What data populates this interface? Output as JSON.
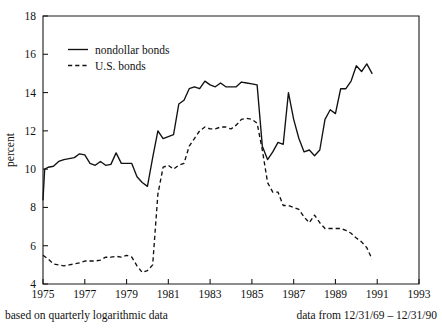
{
  "chart_data": {
    "type": "line",
    "title": "",
    "xlabel": "",
    "ylabel": "percent",
    "xlim": [
      1975,
      1993
    ],
    "ylim": [
      4,
      18
    ],
    "grid": false,
    "legend_position": "top-left-inside",
    "xticks": [
      "1975",
      "1977",
      "1979",
      "1981",
      "1983",
      "1985",
      "1987",
      "1989",
      "1991",
      "1993"
    ],
    "xtick_values": [
      1975,
      1977,
      1979,
      1981,
      1983,
      1985,
      1987,
      1989,
      1991,
      1993
    ],
    "yticks": [
      "4",
      "6",
      "8",
      "10",
      "12",
      "14",
      "16",
      "18"
    ],
    "ytick_values": [
      4,
      6,
      8,
      10,
      12,
      14,
      16,
      18
    ],
    "series": [
      {
        "name": "nondollar bonds",
        "style": "solid",
        "color": "#111111",
        "x": [
          1975.0,
          1975.08,
          1975.25,
          1975.5,
          1975.75,
          1976.0,
          1976.25,
          1976.5,
          1976.75,
          1977.0,
          1977.25,
          1977.5,
          1977.75,
          1978.0,
          1978.25,
          1978.5,
          1978.75,
          1979.0,
          1979.25,
          1979.5,
          1979.75,
          1980.0,
          1980.25,
          1980.5,
          1980.75,
          1981.0,
          1981.25,
          1981.5,
          1981.75,
          1982.0,
          1982.25,
          1982.5,
          1982.75,
          1983.0,
          1983.25,
          1983.5,
          1983.75,
          1984.0,
          1984.25,
          1984.5,
          1984.75,
          1985.0,
          1985.25,
          1985.5,
          1985.75,
          1986.0,
          1986.25,
          1986.5,
          1986.75,
          1987.0,
          1987.25,
          1987.5,
          1987.75,
          1988.0,
          1988.25,
          1988.5,
          1988.75,
          1989.0,
          1989.25,
          1989.5,
          1989.75,
          1990.0,
          1990.25,
          1990.5,
          1990.75
        ],
        "y": [
          8.4,
          10.0,
          10.1,
          10.15,
          10.4,
          10.5,
          10.55,
          10.6,
          10.8,
          10.75,
          10.3,
          10.2,
          10.4,
          10.2,
          10.25,
          10.85,
          10.3,
          10.3,
          10.3,
          9.6,
          9.3,
          9.1,
          10.6,
          12.0,
          11.6,
          11.7,
          11.8,
          13.4,
          13.6,
          14.2,
          14.3,
          14.2,
          14.6,
          14.4,
          14.3,
          14.5,
          14.3,
          14.3,
          14.3,
          14.55,
          14.5,
          14.45,
          14.4,
          11.2,
          10.5,
          10.9,
          11.4,
          11.3,
          14.0,
          12.6,
          11.6,
          10.9,
          11.0,
          10.7,
          11.0,
          12.6,
          13.1,
          12.9,
          14.2,
          14.2,
          14.6,
          15.4,
          15.1,
          15.5,
          15.0
        ]
      },
      {
        "name": "U.S. bonds",
        "style": "dashed",
        "color": "#111111",
        "x": [
          1975.0,
          1975.25,
          1975.5,
          1975.75,
          1976.0,
          1976.25,
          1976.5,
          1976.75,
          1977.0,
          1977.25,
          1977.5,
          1977.75,
          1978.0,
          1978.25,
          1978.5,
          1978.75,
          1979.0,
          1979.25,
          1979.5,
          1979.75,
          1980.0,
          1980.25,
          1980.5,
          1980.75,
          1981.0,
          1981.25,
          1981.5,
          1981.75,
          1982.0,
          1982.25,
          1982.5,
          1982.75,
          1983.0,
          1983.25,
          1983.5,
          1983.75,
          1984.0,
          1984.25,
          1984.5,
          1984.75,
          1985.0,
          1985.25,
          1985.5,
          1985.75,
          1986.0,
          1986.25,
          1986.5,
          1986.75,
          1987.0,
          1987.25,
          1987.5,
          1987.75,
          1988.0,
          1988.25,
          1988.5,
          1988.75,
          1989.0,
          1989.25,
          1989.5,
          1989.75,
          1990.0,
          1990.25,
          1990.5,
          1990.75
        ],
        "y": [
          5.5,
          5.3,
          5.05,
          5.0,
          4.95,
          5.0,
          5.05,
          5.1,
          5.2,
          5.2,
          5.2,
          5.25,
          5.4,
          5.4,
          5.45,
          5.4,
          5.5,
          5.4,
          4.95,
          4.6,
          4.7,
          5.0,
          8.7,
          10.1,
          10.2,
          10.0,
          10.2,
          10.3,
          11.2,
          11.6,
          12.0,
          12.2,
          12.1,
          12.1,
          12.2,
          12.2,
          12.1,
          12.3,
          12.6,
          12.65,
          12.6,
          12.4,
          11.0,
          9.3,
          8.8,
          8.8,
          8.1,
          8.1,
          8.0,
          7.9,
          7.5,
          7.2,
          7.6,
          7.2,
          6.9,
          6.9,
          6.9,
          6.9,
          6.8,
          6.65,
          6.4,
          6.2,
          5.9,
          5.3
        ]
      }
    ],
    "caption_left": "based on quarterly logarithmic data",
    "caption_right": "data from 12/31/69 – 12/31/90"
  },
  "legend": {
    "items": [
      {
        "label": "nondollar bonds",
        "style": "solid"
      },
      {
        "label": "U.S. bonds",
        "style": "dashed"
      }
    ]
  }
}
